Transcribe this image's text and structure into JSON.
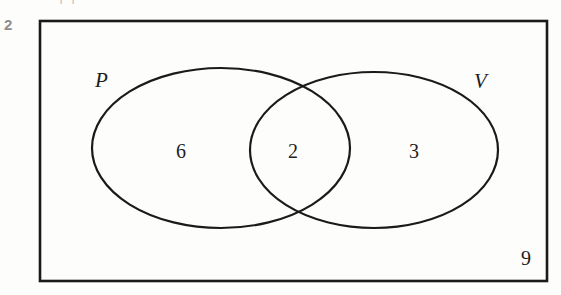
{
  "question_number": "2",
  "top_text_remnant": "( )",
  "diagram": {
    "type": "venn-two-set",
    "universal_set_label": "",
    "sets": [
      {
        "id": "P",
        "label": "P",
        "label_position": "upper-left-outside"
      },
      {
        "id": "V",
        "label": "V",
        "label_position": "upper-right-outside"
      }
    ],
    "regions": [
      {
        "id": "P-only",
        "label": "6",
        "description": "in P only"
      },
      {
        "id": "both",
        "label": "2",
        "description": "in P and V"
      },
      {
        "id": "V-only",
        "label": "3",
        "description": "in V only"
      },
      {
        "id": "neither",
        "label": "9",
        "description": "outside both sets"
      }
    ],
    "colors": {
      "stroke": "#1a1a1a",
      "fill": "none",
      "background": "#fdfdfc",
      "text": "#1e1e1e",
      "question_number": "#8d8d8d"
    },
    "geometry": {
      "rectangle": {
        "x": 40,
        "y": 21,
        "width": 507,
        "height": 260,
        "stroke_width": 2.6
      },
      "ellipse_P": {
        "cx": 221,
        "cy": 148,
        "rx": 129,
        "ry": 80,
        "stroke_width": 2.2
      },
      "ellipse_V": {
        "cx": 374,
        "cy": 150,
        "rx": 124,
        "ry": 78,
        "stroke_width": 2.2
      }
    }
  }
}
